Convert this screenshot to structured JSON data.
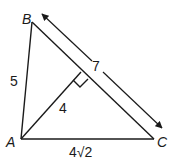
{
  "diagram": {
    "type": "geometry-triangle",
    "vertices": {
      "A": {
        "label": "A",
        "x": 21,
        "y": 139
      },
      "B": {
        "label": "B",
        "x": 32,
        "y": 22
      },
      "C": {
        "label": "C",
        "x": 154,
        "y": 139
      }
    },
    "altitude_foot": {
      "x": 81,
      "y": 72
    },
    "side_labels": {
      "AB": "5",
      "altitude": "4",
      "AC": "4√2",
      "BC": "7"
    },
    "colors": {
      "stroke": "#1a1a1a",
      "background": "#ffffff"
    }
  }
}
